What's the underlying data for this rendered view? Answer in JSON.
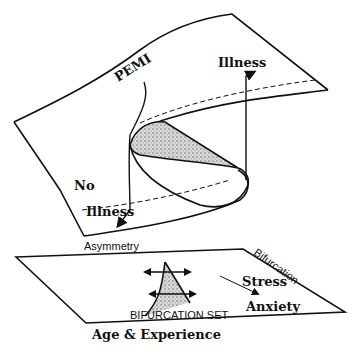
{
  "diagram": {
    "type": "cusp catastrophe model",
    "surface": {
      "labels": {
        "pemi": "PEMI",
        "illness": "Illness",
        "no": "No",
        "no_illness": "Illness"
      }
    },
    "control_plane": {
      "labels": {
        "asymmetry": "Asymmetry",
        "bifurcation": "Bifurcation",
        "stress": "Stress",
        "anxiety": "Anxiety",
        "bifurcation_set": "BIFURCATION SET",
        "age_experience": "Age & Experience"
      }
    },
    "colors": {
      "line": "#111111",
      "shade": "#9a9a9a",
      "background": "#ffffff"
    }
  }
}
